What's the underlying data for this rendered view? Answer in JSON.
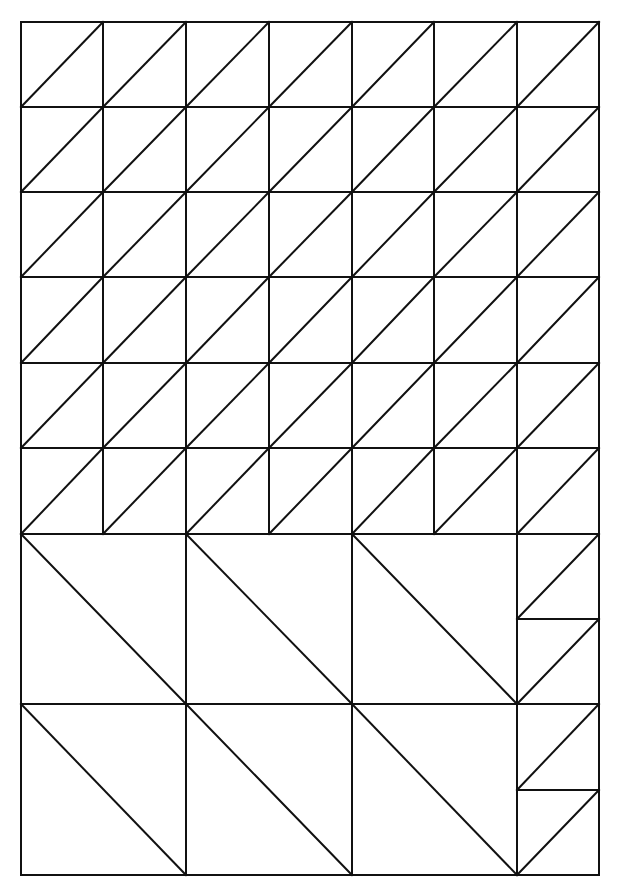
{
  "diagram": {
    "type": "triangle-grid-pattern",
    "stroke_color": "#111111",
    "background": "#ffffff",
    "frame": {
      "left": 21,
      "top": 22,
      "right": 599,
      "bottom": 875
    },
    "columns_x": [
      21,
      103,
      186,
      269,
      352,
      434,
      517,
      599
    ],
    "small_rows_y": [
      22,
      107,
      192,
      277,
      363,
      448,
      534
    ],
    "big_rows_y": [
      534,
      704,
      875
    ],
    "big_square_cols_x": [
      21,
      186,
      352,
      517
    ],
    "right_strip_splits_y": [
      619,
      790
    ],
    "small_grid": {
      "cols": 7,
      "rows": 6,
      "diagonal": "bottom-left-to-top-right"
    },
    "big_squares": {
      "cols": 3,
      "rows": 2,
      "diagonal": "top-left-to-bottom-right"
    },
    "right_strip": {
      "cells": 4,
      "diagonal": "bottom-left-to-top-right"
    }
  }
}
